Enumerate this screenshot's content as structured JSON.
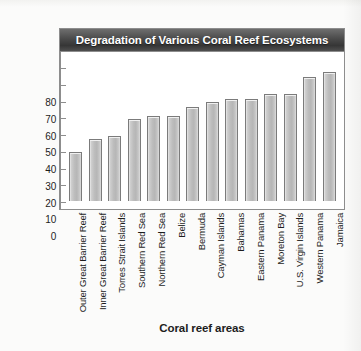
{
  "chart_data": {
    "type": "bar",
    "title": "Degradation of Various Coral Reef Ecosystems",
    "xlabel": "Coral reef areas",
    "ylabel": "Percent degradation",
    "ylim": [
      0,
      80
    ],
    "ytick_labels": [
      "80",
      "70",
      "60",
      "50",
      "40",
      "30",
      "20",
      "10",
      "0"
    ],
    "ytick_values": [
      80,
      70,
      60,
      50,
      40,
      30,
      20,
      10,
      0
    ],
    "grid": false,
    "legend": "none",
    "categories": [
      "Outer Great Barrier Reef",
      "Inner Great Barrier Reef",
      "Torres Strait Islands",
      "Southern Red Sea",
      "Northern Red Sea",
      "Belize",
      "Bermuda",
      "Cayman Islands",
      "Bahamas",
      "Eastern Panama",
      "Moreton Bay",
      "U.S. Virgin Islands",
      "Western Panama",
      "Jamaica"
    ],
    "values": [
      29,
      37,
      39,
      49,
      51,
      51,
      56,
      59,
      61,
      61,
      64,
      64,
      74,
      77
    ],
    "colors": {
      "bar_fill": "#bdbdbd",
      "bar_border": "#7b7b7b",
      "title_bar": "#4a4a4a",
      "title_text": "#ffffff",
      "plot_background": "#ffffff",
      "axis": "#8d8d8d",
      "text": "#1d1d1d",
      "page_background": "#fbfbfa"
    }
  }
}
